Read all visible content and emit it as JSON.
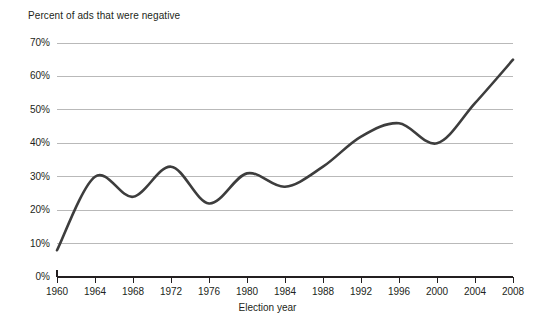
{
  "chart_data": {
    "type": "line",
    "title": "Percent of ads that were negative",
    "xlabel": "Election year",
    "ylabel": "",
    "categories": [
      1960,
      1964,
      1968,
      1972,
      1976,
      1980,
      1984,
      1988,
      1992,
      1996,
      2000,
      2004,
      2008
    ],
    "x": [
      1960,
      1964,
      1968,
      1972,
      1976,
      1980,
      1984,
      1988,
      1992,
      1996,
      2000,
      2004,
      2008
    ],
    "values": [
      8,
      30,
      24,
      33,
      22,
      31,
      27,
      33,
      42,
      46,
      40,
      52,
      65
    ],
    "series": [
      {
        "name": "Percent of ads that were negative",
        "values": [
          8,
          30,
          24,
          33,
          22,
          31,
          27,
          33,
          42,
          46,
          40,
          52,
          65
        ]
      }
    ],
    "xlim": [
      1960,
      2008
    ],
    "ylim": [
      0,
      70
    ],
    "ytick_labels": [
      "0%",
      "10%",
      "20%",
      "30%",
      "40%",
      "50%",
      "60%",
      "70%"
    ],
    "ytick_values": [
      0,
      10,
      20,
      30,
      40,
      50,
      60,
      70
    ],
    "xtick_labels": [
      "1960",
      "1964",
      "1968",
      "1972",
      "1976",
      "1980",
      "1984",
      "1988",
      "1992",
      "1996",
      "2000",
      "2004",
      "2008"
    ],
    "grid": true,
    "grid_axis": "y",
    "legend": false,
    "legend_position": "none",
    "line_color": "#3d3d3d",
    "grid_color": "#b9b9b9",
    "axis_color": "#231f20",
    "smoothing": "spline"
  },
  "axis": {
    "y_labels": [
      {
        "text": "70%",
        "value": 70
      },
      {
        "text": "60%",
        "value": 60
      },
      {
        "text": "50%",
        "value": 50
      },
      {
        "text": "40%",
        "value": 40
      },
      {
        "text": "30%",
        "value": 30
      },
      {
        "text": "20%",
        "value": 20
      },
      {
        "text": "10%",
        "value": 10
      },
      {
        "text": "0%",
        "value": 0
      }
    ],
    "x_labels": [
      {
        "text": "1960"
      },
      {
        "text": "1964"
      },
      {
        "text": "1968"
      },
      {
        "text": "1972"
      },
      {
        "text": "1976"
      },
      {
        "text": "1980"
      },
      {
        "text": "1984"
      },
      {
        "text": "1988"
      },
      {
        "text": "1992"
      },
      {
        "text": "1996"
      },
      {
        "text": "2000"
      },
      {
        "text": "2004"
      },
      {
        "text": "2008"
      }
    ],
    "x_title": "Election year"
  }
}
